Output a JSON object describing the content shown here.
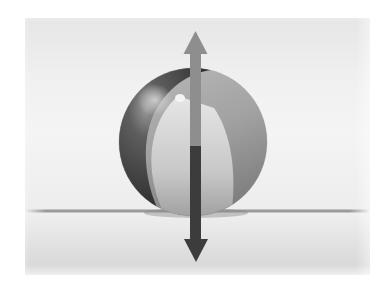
{
  "diagram": {
    "type": "force-diagram",
    "canvas": {
      "width": 387,
      "height": 281
    },
    "colors": {
      "background": "#ffffff",
      "sky_panel": "#ececec",
      "ground_panel": "#e2e2e2",
      "ground_line": "#9a9a9a",
      "ball_dark_band": "#3a3a3a",
      "ball_light_segment": "#d4d4d4",
      "ball_mid_segment": "#a6a6a6",
      "up_arrow": "#8e8e8e",
      "down_arrow": "#3c3c3c"
    },
    "ball": {
      "cx": 193,
      "cy": 142,
      "r": 74
    },
    "ground": {
      "y": 211,
      "x_start": 25,
      "x_end": 370
    },
    "forces": [
      {
        "name": "upward-force",
        "direction": "up",
        "tip": [
          195,
          31
        ],
        "base_y": 146,
        "shaft_width": 11,
        "head_width": 24,
        "head_length": 23
      },
      {
        "name": "downward-force",
        "direction": "down",
        "tip": [
          196,
          262
        ],
        "base_y": 146,
        "shaft_width": 11,
        "head_width": 24,
        "head_length": 23
      }
    ]
  }
}
